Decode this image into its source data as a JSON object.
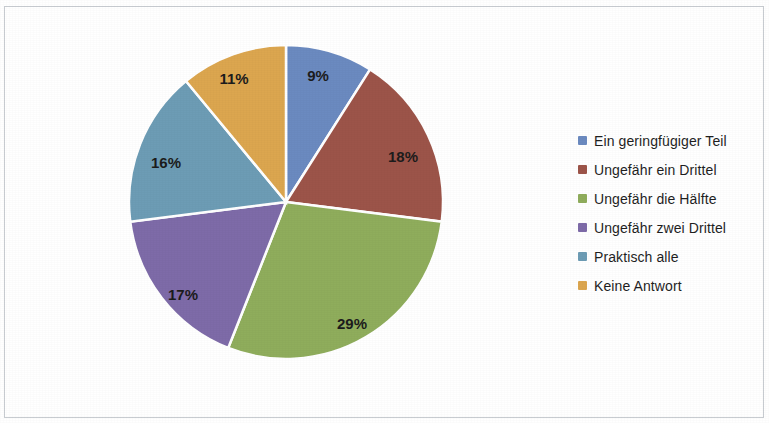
{
  "chart_data": {
    "type": "pie",
    "title": "",
    "subtitle": "",
    "xlabel": "",
    "ylabel": "",
    "legend_position": "right",
    "grid": false,
    "start_angle_deg": 0,
    "direction": "clockwise",
    "categories": [
      "Ein geringfügiger Teil",
      "Ungefähr ein Drittel",
      "Ungefähr die Hälfte",
      "Ungefähr zwei Drittel",
      "Praktisch alle",
      "Keine Antwort"
    ],
    "values": [
      9,
      18,
      29,
      17,
      16,
      11
    ],
    "value_labels": [
      "9%",
      "18%",
      "29%",
      "17%",
      "16%",
      "11%"
    ],
    "colors": [
      "#6B8AC0",
      "#9C5449",
      "#8FAD5C",
      "#7E6BA8",
      "#6D9CB5",
      "#DCA64F"
    ],
    "total": 100,
    "units": "percent"
  },
  "pie": {
    "center_x": 286,
    "center_y": 202,
    "radius": 157,
    "slices": [
      {
        "label": "Ein geringfügiger Teil",
        "value": 9,
        "text": "9%",
        "color": "#6B8AC0",
        "label_x": 318,
        "label_y": 77
      },
      {
        "label": "Ungefähr ein Drittel",
        "value": 18,
        "text": "18%",
        "color": "#9C5449",
        "label_x": 403,
        "label_y": 158
      },
      {
        "label": "Ungefähr die Hälfte",
        "value": 29,
        "text": "29%",
        "color": "#8FAD5C",
        "label_x": 352,
        "label_y": 325
      },
      {
        "label": "Ungefähr zwei Drittel",
        "value": 17,
        "text": "17%",
        "color": "#7E6BA8",
        "label_x": 183,
        "label_y": 296
      },
      {
        "label": "Praktisch alle",
        "value": 16,
        "text": "16%",
        "color": "#6D9CB5",
        "label_x": 166,
        "label_y": 164
      },
      {
        "label": "Keine Antwort",
        "value": 11,
        "text": "11%",
        "color": "#DCA64F",
        "label_x": 234,
        "label_y": 80
      }
    ]
  },
  "legend": {
    "items": [
      {
        "label": "Ein geringfügiger Teil",
        "color": "#6B8AC0"
      },
      {
        "label": "Ungefähr ein Drittel",
        "color": "#9C5449"
      },
      {
        "label": "Ungefähr die Hälfte",
        "color": "#8FAD5C"
      },
      {
        "label": "Ungefähr zwei Drittel",
        "color": "#7E6BA8"
      },
      {
        "label": "Praktisch alle",
        "color": "#6D9CB5"
      },
      {
        "label": "Keine Antwort",
        "color": "#DCA64F"
      }
    ]
  }
}
